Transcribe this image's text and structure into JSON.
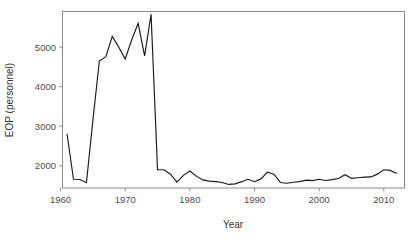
{
  "chart_data": {
    "type": "line",
    "title": "",
    "subtitle": "",
    "xlabel": "Year",
    "ylabel": "EOP (personnel)",
    "xlim": [
      1960.3,
      2013.2
    ],
    "ylim": [
      1440,
      5900
    ],
    "grid": false,
    "legend": null,
    "xticks": [
      1960,
      1970,
      1980,
      1990,
      2000,
      2010
    ],
    "xticklabels": [
      "1960",
      "1970",
      "1980",
      "1990",
      "2000",
      "2010"
    ],
    "yticks": [
      2000,
      3000,
      4000,
      5000
    ],
    "yticklabels": [
      "2000",
      "3000",
      "4000",
      "5000"
    ],
    "line_color": "#1a1a1a",
    "frame_color": "#8a8a8a",
    "series": [
      {
        "name": "EOP personnel",
        "x": [
          1961,
          1962,
          1963,
          1964,
          1965,
          1966,
          1967,
          1968,
          1969,
          1970,
          1971,
          1972,
          1973,
          1974,
          1975,
          1976,
          1977,
          1978,
          1979,
          1980,
          1981,
          1982,
          1983,
          1984,
          1985,
          1986,
          1987,
          1988,
          1989,
          1990,
          1991,
          1992,
          1993,
          1994,
          1995,
          1996,
          1997,
          1998,
          1999,
          2000,
          2001,
          2002,
          2003,
          2004,
          2005,
          2006,
          2007,
          2008,
          2009,
          2010,
          2011,
          2012
        ],
        "values": [
          2810,
          1660,
          1655,
          1575,
          3150,
          4650,
          4760,
          5270,
          5000,
          4700,
          5180,
          5600,
          4780,
          5830,
          1905,
          1900,
          1790,
          1590,
          1760,
          1870,
          1740,
          1645,
          1615,
          1600,
          1580,
          1530,
          1545,
          1600,
          1660,
          1600,
          1670,
          1840,
          1790,
          1580,
          1560,
          1585,
          1600,
          1640,
          1625,
          1660,
          1630,
          1650,
          1680,
          1775,
          1685,
          1700,
          1715,
          1720,
          1790,
          1900,
          1885,
          1805
        ]
      }
    ]
  },
  "axis": {
    "ylabel_text": "EOP (personnel)",
    "xlabel_text": "Year"
  }
}
